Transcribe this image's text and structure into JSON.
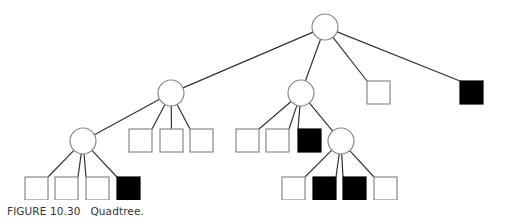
{
  "caption": {
    "label": "FIGURE 10.30",
    "title": "Quadtree."
  },
  "colors": {
    "edge": "#333333",
    "node_stroke": "#888888",
    "filled": "#000000",
    "empty": "#ffffff"
  },
  "tree": {
    "nodes": [
      {
        "id": "root",
        "type": "internal",
        "cx": 325,
        "cy": 27,
        "r": 13
      },
      {
        "id": "n1",
        "type": "internal",
        "cx": 171,
        "cy": 93,
        "r": 13,
        "parent": "root"
      },
      {
        "id": "n2",
        "type": "internal",
        "cx": 301,
        "cy": 93,
        "r": 13,
        "parent": "root"
      },
      {
        "id": "l3",
        "type": "leaf",
        "filled": false,
        "x": 367,
        "y": 81,
        "parent": "root"
      },
      {
        "id": "l4",
        "type": "leaf",
        "filled": true,
        "x": 460,
        "y": 81,
        "parent": "root"
      },
      {
        "id": "n11",
        "type": "internal",
        "cx": 83,
        "cy": 141,
        "r": 13,
        "parent": "n1"
      },
      {
        "id": "l12",
        "type": "leaf",
        "filled": false,
        "x": 129,
        "y": 129,
        "parent": "n1"
      },
      {
        "id": "l13",
        "type": "leaf",
        "filled": false,
        "x": 160,
        "y": 129,
        "parent": "n1"
      },
      {
        "id": "l14",
        "type": "leaf",
        "filled": false,
        "x": 190,
        "y": 129,
        "parent": "n1"
      },
      {
        "id": "l21",
        "type": "leaf",
        "filled": false,
        "x": 236,
        "y": 129,
        "parent": "n2"
      },
      {
        "id": "l22",
        "type": "leaf",
        "filled": false,
        "x": 266,
        "y": 129,
        "parent": "n2"
      },
      {
        "id": "l23",
        "type": "leaf",
        "filled": true,
        "x": 298,
        "y": 129,
        "parent": "n2"
      },
      {
        "id": "n24",
        "type": "internal",
        "cx": 341,
        "cy": 141,
        "r": 13,
        "parent": "n2"
      },
      {
        "id": "l111",
        "type": "leaf",
        "filled": false,
        "x": 25,
        "y": 177,
        "parent": "n11"
      },
      {
        "id": "l112",
        "type": "leaf",
        "filled": false,
        "x": 55,
        "y": 177,
        "parent": "n11"
      },
      {
        "id": "l113",
        "type": "leaf",
        "filled": false,
        "x": 86,
        "y": 177,
        "parent": "n11"
      },
      {
        "id": "l114",
        "type": "leaf",
        "filled": true,
        "x": 117,
        "y": 177,
        "parent": "n11"
      },
      {
        "id": "l241",
        "type": "leaf",
        "filled": false,
        "x": 282,
        "y": 177,
        "parent": "n24"
      },
      {
        "id": "l242",
        "type": "leaf",
        "filled": true,
        "x": 313,
        "y": 177,
        "parent": "n24"
      },
      {
        "id": "l243",
        "type": "leaf",
        "filled": true,
        "x": 343,
        "y": 177,
        "parent": "n24"
      },
      {
        "id": "l244",
        "type": "leaf",
        "filled": false,
        "x": 374,
        "y": 177,
        "parent": "n24"
      }
    ],
    "leaf_size": 23
  }
}
